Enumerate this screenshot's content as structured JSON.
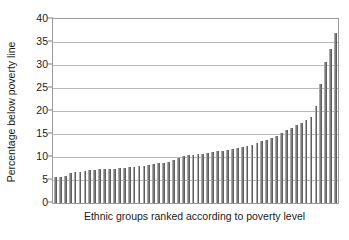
{
  "chart_data": {
    "type": "bar",
    "title": "",
    "subtitle": "",
    "xlabel": "Ethnic groups ranked according to poverty level",
    "ylabel": "Percentage below poverty line",
    "ylim": [
      0,
      40
    ],
    "ytick_labels": [
      "0",
      "5",
      "10",
      "15",
      "20",
      "25",
      "30",
      "35",
      "40"
    ],
    "ytick_values": [
      0,
      5,
      10,
      15,
      20,
      25,
      30,
      35,
      40
    ],
    "xtick_labels": [],
    "grid": "horizontal",
    "legend": "none",
    "bar_color": "#7d7d7d",
    "gridline_color": "#b9b9b9",
    "axis_color": "#9a9a9a",
    "text_color": "#1a1a1a",
    "n_bars": 57,
    "values": [
      5.6,
      5.6,
      5.8,
      6.6,
      6.7,
      6.8,
      7.0,
      7.1,
      7.2,
      7.3,
      7.3,
      7.4,
      7.5,
      7.6,
      7.7,
      7.8,
      7.9,
      8.0,
      8.1,
      8.2,
      8.4,
      8.6,
      8.8,
      9.0,
      9.4,
      9.7,
      10.2,
      10.4,
      10.5,
      10.6,
      10.7,
      10.8,
      11.0,
      11.2,
      11.4,
      11.6,
      11.7,
      11.9,
      12.1,
      12.3,
      12.6,
      13.0,
      13.4,
      13.8,
      14.2,
      14.6,
      15.2,
      15.8,
      16.4,
      16.9,
      17.4,
      18.0,
      18.6,
      21.0,
      25.8,
      30.6,
      33.5,
      37.0
    ]
  }
}
